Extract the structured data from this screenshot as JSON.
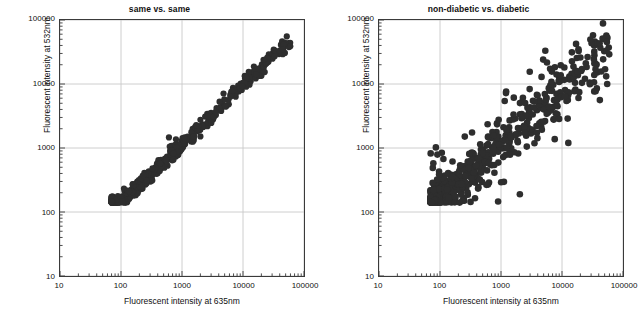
{
  "figure": {
    "background": "#ffffff",
    "marker_color": "#2e2e2e",
    "grid_color": "#c8c8c8",
    "axis_color": "#3a3a3a"
  },
  "chart_data": [
    {
      "type": "scatter",
      "title": "same vs. same",
      "xlabel": "Fluorescent intensity at 635nm",
      "ylabel": "Fluorescent intensity at 532nm",
      "xscale": "log",
      "yscale": "log",
      "xlim": [
        10,
        100000
      ],
      "ylim": [
        10,
        100000
      ],
      "xticks": [
        10,
        100,
        1000,
        10000,
        100000
      ],
      "xtick_labels": [
        "10",
        "100",
        "1000",
        "10000",
        "100000"
      ],
      "yticks": [
        10,
        100,
        1000,
        10000,
        100000
      ],
      "ytick_labels": [
        "10",
        "100",
        "1000",
        "10000",
        "100000"
      ],
      "grid": true,
      "legend": false,
      "n_points": 620,
      "marker_size": 3.1,
      "description": "Tight linear correlation along the identity diagonal; points span x from about 70 to 60000 and y from about 140 to 40000.",
      "fit": {
        "slope": 0.92,
        "intercept_log10": 0.3,
        "scatter_log10": 0.055
      },
      "x_range_data": [
        70,
        60000
      ],
      "y_range_data": [
        140,
        40000
      ],
      "seed": 20412
    },
    {
      "type": "scatter",
      "title": "non-diabetic vs. diabetic",
      "xlabel": "Fluorescent intensity at 635nm",
      "ylabel": "Fluorescent intensity at 532nm",
      "xscale": "log",
      "yscale": "log",
      "xlim": [
        10,
        100000
      ],
      "ylim": [
        10,
        100000
      ],
      "xticks": [
        10,
        100,
        1000,
        10000,
        100000
      ],
      "xtick_labels": [
        "10",
        "100",
        "1000",
        "10000",
        "100000"
      ],
      "yticks": [
        10,
        100,
        1000,
        10000,
        100000
      ],
      "ytick_labels": [
        "10",
        "100",
        "1000",
        "10000",
        "100000"
      ],
      "grid": true,
      "legend": false,
      "n_points": 700,
      "marker_size": 3.3,
      "description": "Broad, dispersed positive correlation with many off-diagonal outliers; points span x from about 70 to 60000 and y from about 140 to 60000.",
      "fit": {
        "slope": 0.88,
        "intercept_log10": 0.42,
        "scatter_log10": 0.2
      },
      "x_range_data": [
        70,
        60000
      ],
      "y_range_data": [
        140,
        60000
      ],
      "seed": 77139
    }
  ]
}
